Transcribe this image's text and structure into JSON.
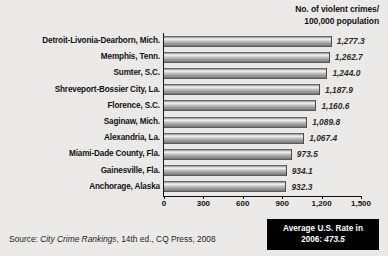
{
  "units_caption": {
    "line1": "No. of violent crimes/",
    "line2": "100,000 population"
  },
  "source": {
    "prefix": "Source:",
    "work": "City Crime Rankings",
    "rest": ", 14th ed., CQ Press, 2008"
  },
  "average_box": {
    "line1": "Average U.S. Rate in",
    "year_label": "2006:",
    "value": "473.5"
  },
  "chart_data": {
    "type": "bar",
    "orientation": "horizontal",
    "title": "",
    "subtitle": "",
    "xlabel": "No. of violent crimes/100,000 population",
    "ylabel": "",
    "xlim": [
      0,
      1500
    ],
    "xticks": [
      0,
      300,
      600,
      900,
      1200,
      1500
    ],
    "xtick_labels": [
      "0",
      "300",
      "600",
      "900",
      "1,200",
      "1,500"
    ],
    "grid": false,
    "legend": "none",
    "categories": [
      "Detroit-Livonia-Dearborn, Mich.",
      "Memphis, Tenn.",
      "Sumter, S.C.",
      "Shreveport-Bossier City, La.",
      "Florence, S.C.",
      "Saginaw, Mich.",
      "Alexandria, La.",
      "Miami-Dade County, Fla.",
      "Gainesville, Fla.",
      "Anchorage, Alaska"
    ],
    "values": [
      1277.3,
      1262.7,
      1244.0,
      1187.9,
      1160.6,
      1089.8,
      1067.4,
      973.5,
      934.1,
      932.3
    ],
    "value_labels": [
      "1,277.3",
      "1,262.7",
      "1,244.0",
      "1,187.9",
      "1,160.6",
      "1,089.8",
      "1,067.4",
      "973.5",
      "934.1",
      "932.3"
    ],
    "annotations": [
      {
        "text": "Average U.S. Rate in 2006: 473.5",
        "value": 473.5
      }
    ],
    "colors": {
      "background": "#edebe9",
      "bar_light": "#f2f2f2",
      "bar_mid": "#a8a8a8",
      "bar_dark": "#3f3f3f",
      "axis": "#111111",
      "annotation_background": "#000000",
      "annotation_text": "#ffffff"
    }
  }
}
